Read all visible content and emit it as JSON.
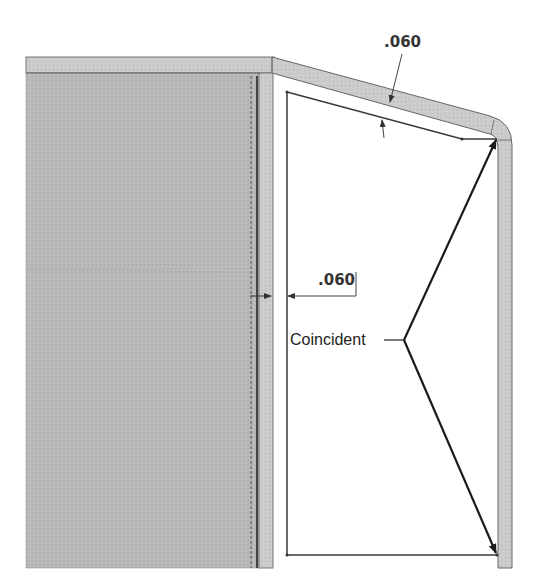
{
  "drawing": {
    "dimensions": [
      {
        "id": "top-thickness",
        "label": ".060"
      },
      {
        "id": "side-thickness",
        "label": ".060"
      }
    ],
    "callout": {
      "label": "Coincident"
    },
    "colors": {
      "panel_fill": "#b8b8b8",
      "flange_fill": "#cdcdcd",
      "sketch_line": "#3a3a3a",
      "arrow": "#1a1a1a",
      "background": "#ffffff"
    }
  }
}
